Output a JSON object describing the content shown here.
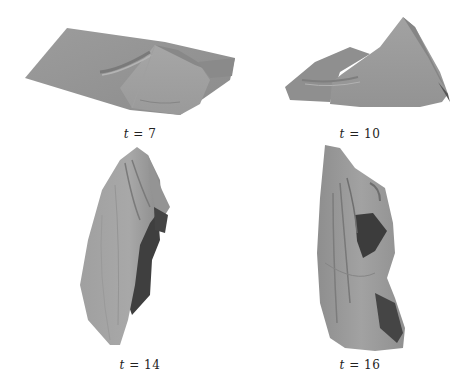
{
  "header": {
    "text": ""
  },
  "figure": {
    "panels": [
      {
        "id": "t7",
        "caption_var": "t",
        "caption_eq": " = ",
        "caption_val": "7",
        "caption": "t = 7"
      },
      {
        "id": "t10",
        "caption_var": "t",
        "caption_eq": " = ",
        "caption_val": "10",
        "caption": "t = 10"
      },
      {
        "id": "t14",
        "caption_var": "t",
        "caption_eq": " = ",
        "caption_val": "14",
        "caption": "t = 14"
      },
      {
        "id": "t16",
        "caption_var": "t",
        "caption_eq": " = ",
        "caption_val": "16",
        "caption": "t = 16"
      }
    ],
    "colors": {
      "cloth_light": "#a8a8a8",
      "cloth_mid": "#949494",
      "cloth_dark": "#6e6e6e",
      "shadow": "#3e3e3e",
      "background": "#ffffff"
    }
  }
}
